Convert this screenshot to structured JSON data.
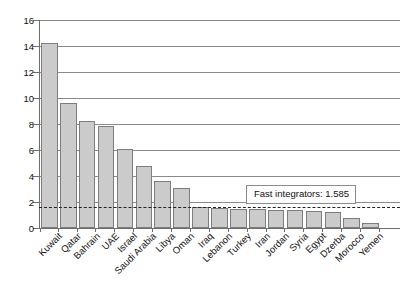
{
  "chart_data": {
    "type": "bar",
    "title": "",
    "xlabel": "",
    "ylabel": "",
    "ylim": [
      0,
      16
    ],
    "yticks": [
      0,
      2,
      4,
      6,
      8,
      10,
      12,
      14,
      16
    ],
    "grid": true,
    "legend": null,
    "categories": [
      "Kuwait",
      "Qatar",
      "Bahrain",
      "UAE",
      "Israel",
      "Saudi Arabia",
      "Libya",
      "Oman",
      "Iraq",
      "Lebanon",
      "Turkey",
      "Iran",
      "Jordan",
      "Syria",
      "Egypt",
      "Dzerba",
      "Morocco",
      "Yemen"
    ],
    "values": [
      14.2,
      9.6,
      8.2,
      7.85,
      6.1,
      4.8,
      3.6,
      3.1,
      1.6,
      1.55,
      1.5,
      1.45,
      1.4,
      1.35,
      1.3,
      1.2,
      0.75,
      0.35
    ],
    "annotations": [
      {
        "name": "fast-integrators-threshold",
        "label": "Fast integrators: 1.585",
        "value": 1.585,
        "line_style": "dashed"
      }
    ],
    "bar_fill_color": "#cbcbcb",
    "bar_border_color": "#7d7d7d",
    "gridline_color": "#8a8a8a",
    "axis_color": "#6e6e6e"
  }
}
